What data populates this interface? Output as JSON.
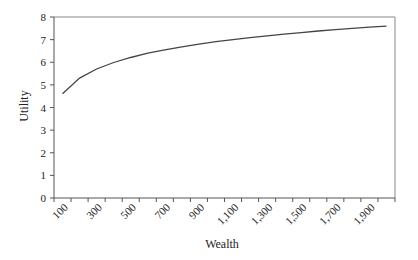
{
  "chart_data": {
    "type": "line",
    "title": "",
    "xlabel": "Wealth",
    "ylabel": "Utility",
    "x": [
      100,
      200,
      300,
      400,
      500,
      600,
      700,
      800,
      900,
      1000,
      1100,
      1200,
      1300,
      1400,
      1500,
      1600,
      1700,
      1800,
      1900,
      2000
    ],
    "x_tick_labels": [
      "100",
      "300",
      "500",
      "700",
      "900",
      "1,100",
      "1,300",
      "1,500",
      "1,700",
      "1,900"
    ],
    "series": [
      {
        "name": "Utility",
        "values": [
          4.61,
          5.3,
          5.7,
          5.99,
          6.21,
          6.4,
          6.55,
          6.68,
          6.8,
          6.91,
          7.0,
          7.09,
          7.17,
          7.24,
          7.31,
          7.38,
          7.44,
          7.5,
          7.55,
          7.6
        ]
      }
    ],
    "ylim": [
      0,
      8
    ],
    "y_ticks": [
      0,
      1,
      2,
      3,
      4,
      5,
      6,
      7,
      8
    ],
    "grid": false,
    "legend": "none",
    "colors": {
      "line": "#444444",
      "axis": "#555555",
      "frame": "#888888"
    }
  }
}
